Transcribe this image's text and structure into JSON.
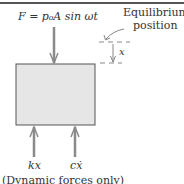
{
  "diagram": {
    "force_label": "F = p₀A sin ωt",
    "equilibrium_label_line1": "Equilibrium",
    "equilibrium_label_line2": "position",
    "displacement_label": "x",
    "spring_force_label": "kx",
    "damper_force_label": "cẋ",
    "caption": "(Dynamic forces only)",
    "colors": {
      "block_fill": "#e6e6e6",
      "block_stroke": "#555555",
      "arrow": "#8a8a8a",
      "dashed": "#888888"
    }
  }
}
